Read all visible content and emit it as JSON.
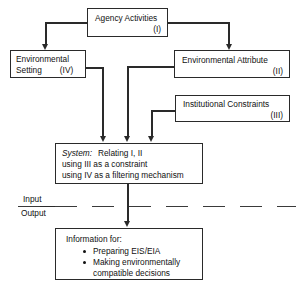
{
  "diagram": {
    "line_color": "#2a2a2a",
    "background": "#ffffff"
  },
  "nodes": {
    "agency": {
      "label": "Agency Activities",
      "numeral": "(I)"
    },
    "environmental_setting": {
      "label_line1": "Environmental",
      "label_line2": "Setting",
      "numeral": "(IV)"
    },
    "environmental_attribute": {
      "label": "Environmental Attribute",
      "numeral": "(II)"
    },
    "institutional_constraints": {
      "label": "Institutional Constraints",
      "numeral": "(III)"
    },
    "system": {
      "keyword": "System:",
      "line1": "Relating I, II",
      "line2": "using III as a constraint",
      "line3": "using IV as a filtering mechanism"
    },
    "information": {
      "header": "Information for:",
      "bullets": [
        "Preparing EIS/EIA",
        "Making environmentally compatible decisions"
      ],
      "bullet_1_line1": "Preparing EIS/EIA",
      "bullet_2_line1": "Making environmentally",
      "bullet_2_line2": "compatible decisions"
    }
  },
  "divider": {
    "input_label": "Input",
    "output_label": "Output"
  }
}
